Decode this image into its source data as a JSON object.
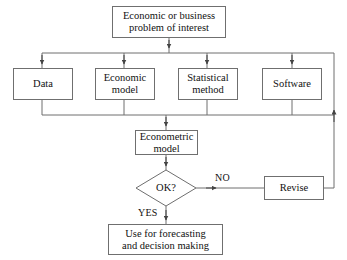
{
  "diagram": {
    "background": "#ffffff",
    "line_color": "#6f6f6f",
    "text_color": "#111111",
    "nodes": {
      "problem": {
        "label": "Economic or business problem of interest",
        "line1": "Economic or business",
        "line2": "problem of interest",
        "shape": "rectangle"
      },
      "data": {
        "label": "Data",
        "line1": "Data",
        "shape": "rectangle"
      },
      "economic_model": {
        "label": "Economic model",
        "line1": "Economic",
        "line2": "model",
        "shape": "rectangle"
      },
      "statistical_method": {
        "label": "Statistical method",
        "line1": "Statistical",
        "line2": "method",
        "shape": "rectangle"
      },
      "software": {
        "label": "Software",
        "line1": "Software",
        "shape": "rectangle"
      },
      "econometric_model": {
        "label": "Econometric model",
        "line1": "Econometric",
        "line2": "model",
        "shape": "rectangle"
      },
      "decision": {
        "label": "OK?",
        "shape": "diamond"
      },
      "revise": {
        "label": "Revise",
        "line1": "Revise",
        "shape": "rectangle"
      },
      "forecast": {
        "label": "Use for forecasting and decision making",
        "line1": "Use for forecasting",
        "line2": "and decision making",
        "shape": "rectangle"
      }
    },
    "edge_labels": {
      "no": "NO",
      "yes": "YES"
    }
  }
}
